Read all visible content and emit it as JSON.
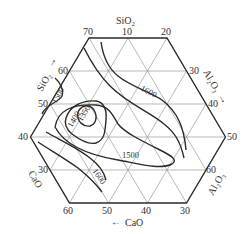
{
  "diagram": {
    "type": "ternary-phase-diagram-hexagonal",
    "components": [
      "SiO2",
      "Al2O3",
      "CaO"
    ],
    "axes": {
      "top": {
        "label": "SiO₂",
        "ticks": [
          "70",
          "10",
          "20"
        ]
      },
      "sio2_side": {
        "label": "SiO₂",
        "arrow": "→",
        "ticks": [
          "60",
          "50",
          "40"
        ]
      },
      "al2o3_upper": {
        "label": "Al₂O₃",
        "arrow": "→",
        "ticks": [
          "30",
          "40",
          "50"
        ]
      },
      "al2o3_lower": {
        "label": "Al₂O₃",
        "ticks": [
          "60"
        ]
      },
      "cao_side": {
        "label": "CaO",
        "ticks": [
          "30"
        ]
      },
      "bottom": {
        "label": "CaO",
        "arrow": "←",
        "ticks": [
          "60",
          "50",
          "40",
          "30"
        ]
      }
    },
    "isotherms": [
      {
        "label": "1350",
        "unit": "°C",
        "shape": "closed"
      },
      {
        "label": "1400",
        "unit": "°C",
        "shape": "closed"
      },
      {
        "label": "1500",
        "unit": "°C",
        "shape": "closed",
        "position": "center"
      },
      {
        "label": "1500",
        "unit": "°C",
        "shape": "open",
        "position": "left-edge"
      },
      {
        "label": "1600",
        "unit": "°C",
        "shape": "open",
        "position": "upper-right"
      },
      {
        "label": "1600",
        "unit": "°C",
        "shape": "open",
        "position": "lower-left"
      }
    ],
    "colors": {
      "line": "#2a2a2a",
      "grid": "#8a8a8a",
      "text": "#333333"
    }
  }
}
